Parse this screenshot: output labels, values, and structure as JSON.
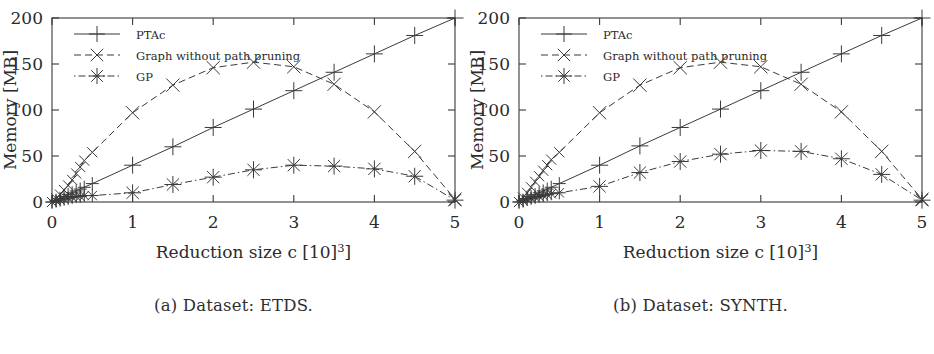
{
  "figure": {
    "panels": [
      {
        "id": "a",
        "caption": "(a) Dataset: ETDS.",
        "chart_ref": 0
      },
      {
        "id": "b",
        "caption": "(b) Dataset: SYNTH.",
        "chart_ref": 1
      }
    ]
  },
  "chart_data": [
    {
      "type": "line",
      "title": "",
      "subtitle": "(a) Dataset: ETDS.",
      "xlabel": "Reduction size c [10³]",
      "ylabel": "Memory [MB]",
      "xlim": [
        0,
        5
      ],
      "ylim": [
        0,
        200
      ],
      "xticks": [
        0,
        1,
        2,
        3,
        4,
        5
      ],
      "xtick_labels": [
        "0",
        "1",
        "2",
        "3",
        "4",
        "5"
      ],
      "yticks": [
        0,
        50,
        100,
        150,
        200
      ],
      "ytick_labels": [
        "0",
        "50",
        "100",
        "150",
        "200"
      ],
      "grid": false,
      "legend_position": "top-left",
      "series": [
        {
          "name": "PTAc",
          "marker": "plus",
          "linestyle": "solid",
          "color": "#3a3a3a",
          "x": [
            0.0,
            0.05,
            0.1,
            0.15,
            0.2,
            0.25,
            0.3,
            0.35,
            0.4,
            0.5,
            1.0,
            1.5,
            2.0,
            2.5,
            3.0,
            3.5,
            4.0,
            4.5,
            5.0
          ],
          "y": [
            0,
            2,
            4,
            6,
            8,
            10,
            12,
            14,
            16,
            20,
            40,
            60,
            81,
            101,
            121,
            141,
            161,
            181,
            200
          ]
        },
        {
          "name": "Graph without path pruning",
          "marker": "cross",
          "linestyle": "dashed",
          "color": "#3a3a3a",
          "x": [
            0.0,
            0.05,
            0.1,
            0.15,
            0.2,
            0.25,
            0.3,
            0.35,
            0.4,
            0.5,
            1.0,
            1.5,
            2.0,
            2.5,
            3.0,
            3.5,
            4.0,
            4.5,
            5.0
          ],
          "y": [
            0,
            4,
            8,
            13,
            18,
            24,
            31,
            38,
            45,
            54,
            97,
            127,
            146,
            152,
            147,
            128,
            98,
            55,
            3
          ]
        },
        {
          "name": "GP",
          "marker": "star",
          "linestyle": "dash-dot",
          "color": "#3a3a3a",
          "x": [
            0.0,
            0.05,
            0.1,
            0.15,
            0.2,
            0.25,
            0.3,
            0.35,
            0.4,
            0.5,
            1.0,
            1.5,
            2.0,
            2.5,
            3.0,
            3.5,
            4.0,
            4.5,
            5.0
          ],
          "y": [
            0,
            1,
            2,
            3,
            4,
            5,
            6,
            6,
            7,
            7,
            10,
            19,
            27,
            35,
            40,
            39,
            36,
            28,
            2
          ]
        }
      ]
    },
    {
      "type": "line",
      "title": "",
      "subtitle": "(b) Dataset: SYNTH.",
      "xlabel": "Reduction size c [10³]",
      "ylabel": "Memory [MB]",
      "xlim": [
        0,
        5
      ],
      "ylim": [
        0,
        200
      ],
      "xticks": [
        0,
        1,
        2,
        3,
        4,
        5
      ],
      "xtick_labels": [
        "0",
        "1",
        "2",
        "3",
        "4",
        "5"
      ],
      "yticks": [
        0,
        50,
        100,
        150,
        200
      ],
      "ytick_labels": [
        "0",
        "50",
        "100",
        "150",
        "200"
      ],
      "grid": false,
      "legend_position": "top-left",
      "series": [
        {
          "name": "PTAc",
          "marker": "plus",
          "linestyle": "solid",
          "color": "#3a3a3a",
          "x": [
            0.0,
            0.05,
            0.1,
            0.15,
            0.2,
            0.25,
            0.3,
            0.35,
            0.4,
            0.5,
            1.0,
            1.5,
            2.0,
            2.5,
            3.0,
            3.5,
            4.0,
            4.5,
            5.0
          ],
          "y": [
            0,
            2,
            4,
            6,
            8,
            10,
            12,
            14,
            16,
            20,
            40,
            61,
            81,
            101,
            121,
            141,
            161,
            181,
            200
          ]
        },
        {
          "name": "Graph without path pruning",
          "marker": "cross",
          "linestyle": "dashed",
          "color": "#3a3a3a",
          "x": [
            0.0,
            0.05,
            0.1,
            0.15,
            0.2,
            0.25,
            0.3,
            0.35,
            0.4,
            0.5,
            1.0,
            1.5,
            2.0,
            2.5,
            3.0,
            3.5,
            4.0,
            4.5,
            5.0
          ],
          "y": [
            0,
            5,
            10,
            16,
            22,
            28,
            34,
            40,
            46,
            54,
            97,
            127,
            146,
            152,
            147,
            128,
            98,
            55,
            3
          ]
        },
        {
          "name": "GP",
          "marker": "star",
          "linestyle": "dash-dot",
          "color": "#3a3a3a",
          "x": [
            0.0,
            0.05,
            0.1,
            0.15,
            0.2,
            0.25,
            0.3,
            0.35,
            0.4,
            0.5,
            1.0,
            1.5,
            2.0,
            2.5,
            3.0,
            3.5,
            4.0,
            4.5,
            5.0
          ],
          "y": [
            0,
            1,
            3,
            4,
            5,
            6,
            7,
            8,
            9,
            10,
            17,
            32,
            44,
            52,
            56,
            55,
            47,
            30,
            2
          ]
        }
      ]
    }
  ]
}
